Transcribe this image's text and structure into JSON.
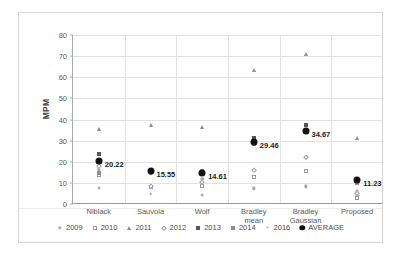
{
  "chart_data": {
    "type": "scatter",
    "title": "",
    "xlabel": "",
    "ylabel": "MPM",
    "ylim": [
      0,
      80
    ],
    "yticks": [
      0,
      10,
      20,
      30,
      40,
      50,
      60,
      70,
      80
    ],
    "grid": true,
    "legend_position": "bottom",
    "categories": [
      "Niblack",
      "Sauvola",
      "Wolf",
      "Bradley mean",
      "Bradley Gaussian",
      "Proposed"
    ],
    "series": [
      {
        "name": "2009",
        "marker": "circle-grey",
        "values": [
          16.5,
          14.2,
          12.0,
          7.4,
          8.3,
          4.2
        ]
      },
      {
        "name": "2010",
        "marker": "open-square",
        "values": [
          13.6,
          7.9,
          8.3,
          13.0,
          15.8,
          2.9
        ]
      },
      {
        "name": "2011",
        "marker": "triangle",
        "values": [
          35.5,
          37.5,
          36.3,
          63.2,
          71.0,
          31.2
        ]
      },
      {
        "name": "2012",
        "marker": "open-diamond",
        "values": [
          18.0,
          8.6,
          10.5,
          16.2,
          22.4,
          5.0
        ]
      },
      {
        "name": "2013",
        "marker": "filled-square",
        "values": [
          23.5,
          15.3,
          14.0,
          31.3,
          37.2,
          11.8
        ]
      },
      {
        "name": "2014",
        "marker": "grey-square",
        "values": [
          14.6,
          16.0,
          15.4,
          28.6,
          35.0,
          9.9
        ]
      },
      {
        "name": "2016",
        "marker": "small-dot",
        "values": [
          7.5,
          4.5,
          4.3,
          29.8,
          34.4,
          6.1
        ]
      },
      {
        "name": "AVERAGE",
        "marker": "filled-circle",
        "values": [
          20.22,
          15.55,
          14.61,
          29.46,
          34.67,
          11.23
        ]
      }
    ],
    "average_labels": [
      "20.22",
      "15.55",
      "14.61",
      "29.46",
      "34.67",
      "11.23"
    ]
  },
  "axis": {
    "y_title": "MPM",
    "y_tick_labels": [
      "80",
      "70",
      "60",
      "50",
      "40",
      "30",
      "20",
      "10",
      "0"
    ],
    "x_tick_labels": [
      [
        "Niblack"
      ],
      [
        "Sauvola"
      ],
      [
        "Wolf"
      ],
      [
        "Bradley",
        "mean"
      ],
      [
        "Bradley",
        "Gaussian"
      ],
      [
        "Proposed"
      ]
    ]
  },
  "legend": {
    "items": [
      {
        "label": "2009",
        "marker": "m-2009"
      },
      {
        "label": "2010",
        "marker": "m-2010"
      },
      {
        "label": "2011",
        "marker": "m-2011"
      },
      {
        "label": "2012",
        "marker": "m-2012"
      },
      {
        "label": "2013",
        "marker": "m-2013"
      },
      {
        "label": "2014",
        "marker": "m-2014"
      },
      {
        "label": "2016",
        "marker": "m-2016"
      },
      {
        "label": "AVERAGE",
        "marker": "m-average"
      }
    ]
  },
  "colors": {
    "average": "#111111",
    "grid": "#e2e2e2",
    "axis": "#9a9a9a",
    "text": "#595959",
    "frame": "#d4d4d4"
  }
}
